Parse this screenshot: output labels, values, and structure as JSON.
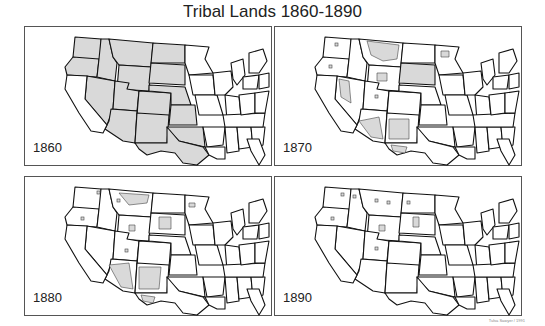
{
  "title": "Tribal Lands 1860-1890",
  "credit": "Tulsa Sawyer / 1991",
  "colors": {
    "tribal_land": "#d9d9d9",
    "state_border": "#111111",
    "panel_border": "#555555"
  },
  "panels": [
    {
      "year": "1860",
      "shaded_states": [
        "WA",
        "OR",
        "ID",
        "MT",
        "WY",
        "NV",
        "UT",
        "CO",
        "AZ",
        "NM",
        "ND",
        "SD",
        "NE",
        "KS",
        "OK",
        "TX"
      ],
      "reservations": []
    },
    {
      "year": "1870",
      "shaded_states": [
        "SD"
      ],
      "reservations": [
        "MT",
        "NV",
        "AZ",
        "NM",
        "WY",
        "TX-W",
        "OK-NE",
        "MN",
        "WA",
        "OR",
        "ID",
        "UT"
      ]
    },
    {
      "year": "1880",
      "shaded_states": [],
      "reservations": [
        "AZ",
        "NM",
        "SD",
        "MT",
        "TX-W",
        "WA",
        "OR",
        "WY",
        "UT",
        "MN",
        "ID"
      ]
    },
    {
      "year": "1890",
      "shaded_states": [],
      "reservations": [
        "SD-small",
        "WY-small",
        "WA-small",
        "OR-small",
        "MT-small",
        "ND-small",
        "UT-small",
        "ID-small"
      ]
    }
  ]
}
